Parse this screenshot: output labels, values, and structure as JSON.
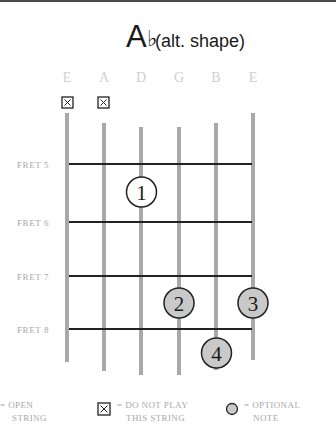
{
  "chord": {
    "root": "A",
    "accidental": "♭",
    "qualifier": "(alt. shape)"
  },
  "strings": [
    "E",
    "A",
    "D",
    "G",
    "B",
    "E"
  ],
  "frets": [
    {
      "label": "FRET 5",
      "number": 5
    },
    {
      "label": "FRET 6",
      "number": 6
    },
    {
      "label": "FRET 7",
      "number": 7
    },
    {
      "label": "FRET 8",
      "number": 8
    }
  ],
  "muted_strings": [
    {
      "string": "E",
      "index": 1,
      "symbol": "✕"
    },
    {
      "string": "A",
      "index": 2,
      "symbol": "✕"
    }
  ],
  "fingers": [
    {
      "finger": "1",
      "string": "D",
      "string_index": 3,
      "fret": 5,
      "optional": false
    },
    {
      "finger": "2",
      "string": "G",
      "string_index": 4,
      "fret": 7,
      "optional": true
    },
    {
      "finger": "3",
      "string": "E",
      "string_index": 6,
      "fret": 7,
      "optional": true
    },
    {
      "finger": "4",
      "string": "B",
      "string_index": 5,
      "fret": 8,
      "optional": true
    }
  ],
  "legend": {
    "open": {
      "line1": "= OPEN",
      "line2": "STRING"
    },
    "mute": {
      "symbol": "✕",
      "line1": "= DO NOT PLAY",
      "line2": "THIS STRING"
    },
    "optional": {
      "line1": "= OPTIONAL",
      "line2": "NOTE"
    }
  },
  "colors": {
    "string": "#a9a9a9",
    "fret": "#222222",
    "optional_fill": "#c9c9c9",
    "finger_fill": "#ffffff"
  }
}
